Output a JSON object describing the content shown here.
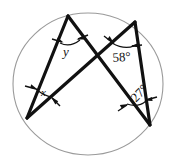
{
  "figure": {
    "kind": "circle-with-two-crossing-angle-chords",
    "background_color": "#ffffff",
    "line_color": "#111111",
    "circle_color": "#9a9a9a",
    "circle": {
      "cx": 88,
      "cy": 84,
      "rx": 75,
      "ry": 71
    },
    "vertices": {
      "top_left": {
        "x": 68,
        "y": 16
      },
      "top_right": {
        "x": 135,
        "y": 22
      },
      "bottom_left": {
        "x": 27,
        "y": 118
      },
      "bottom_right": {
        "x": 150,
        "y": 125
      },
      "crossing": {
        "x": 95,
        "y": 55
      }
    },
    "chords": [
      {
        "name": "chord-topleft-to-bottomleft",
        "from": "top_left",
        "to": "bottom_left"
      },
      {
        "name": "chord-topleft-to-bottomright",
        "from": "top_left",
        "to": "bottom_right"
      },
      {
        "name": "chord-topright-to-bottomleft",
        "from": "top_right",
        "to": "bottom_left"
      },
      {
        "name": "chord-topright-to-bottomright",
        "from": "top_right",
        "to": "bottom_right"
      }
    ],
    "angles": [
      {
        "id": "y",
        "label": "y",
        "location": "top-left-vertex",
        "value": "y",
        "known": false
      },
      {
        "id": "angle-58",
        "label": "58°",
        "location": "top-right-vertex",
        "value": "58",
        "unit": "degrees",
        "known": true
      },
      {
        "id": "x",
        "label": "x",
        "location": "bottom-left-vertex",
        "value": "x",
        "known": false
      },
      {
        "id": "angle-27",
        "label": "27°",
        "location": "bottom-right-vertex",
        "value": "27",
        "unit": "degrees",
        "known": true
      }
    ]
  }
}
